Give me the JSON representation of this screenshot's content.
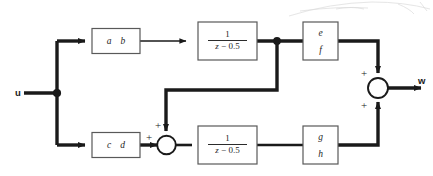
{
  "figure": {
    "kind": "control-system-block-diagram",
    "line_color": "#1a1a1a",
    "box_stroke": "#595959",
    "text_color": "#262626"
  },
  "io": {
    "input_label": "u",
    "output_label": "w"
  },
  "blocks": {
    "gain_ab": {
      "left_letter": "a",
      "right_letter": "b"
    },
    "gain_cd": {
      "left_letter": "c",
      "right_letter": "d"
    },
    "gain_ef": {
      "top_letter": "e",
      "bottom_letter": "f"
    },
    "gain_gh": {
      "top_letter": "g",
      "bottom_letter": "h"
    },
    "transfer_top": {
      "numerator": "1",
      "denominator_z": "z",
      "denominator_rest": " − 0.5",
      "full": "1/(z - 0.5)"
    },
    "transfer_bottom": {
      "numerator": "1",
      "denominator_z": "z",
      "denominator_rest": " − 0.5",
      "full": "1/(z - 0.5)"
    }
  },
  "summing_junctions": {
    "middle": {
      "sign_from_gain_cd": "+",
      "sign_from_feedback": "+"
    },
    "output": {
      "sign_from_top_branch": "+",
      "sign_from_bottom_branch": "+"
    }
  }
}
